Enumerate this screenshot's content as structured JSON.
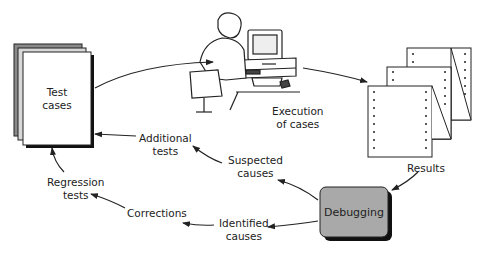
{
  "nodes": {
    "test_cases": "Test\ncases",
    "execution": [
      "Execution",
      "of cases"
    ],
    "results": "Results",
    "debugging": "Debugging",
    "suspected_causes": [
      "Suspected",
      "causes"
    ],
    "identified_causes": [
      "Identified",
      "causes"
    ],
    "additional_tests": [
      "Additional",
      "tests"
    ],
    "corrections": "Corrections",
    "regression_tests": [
      "Regression",
      "tests"
    ]
  },
  "colors": {
    "debug_box": "#a9a9a9",
    "stack_gray": "#888888",
    "line": "#222222"
  }
}
